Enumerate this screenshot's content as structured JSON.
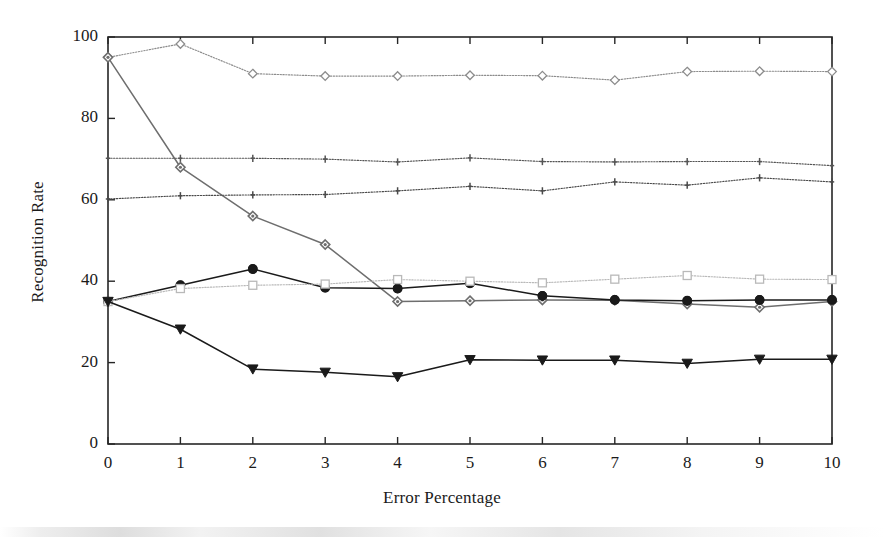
{
  "chart_data": {
    "type": "line",
    "title": "",
    "xlabel": "Error Percentage",
    "ylabel": "Recognition Rate",
    "x": [
      0,
      1,
      2,
      3,
      4,
      5,
      6,
      7,
      8,
      9,
      10
    ],
    "xlim": [
      0,
      10
    ],
    "ylim": [
      0,
      100
    ],
    "xticks": [
      "0",
      "1",
      "2",
      "3",
      "4",
      "5",
      "6",
      "7",
      "8",
      "9",
      "10"
    ],
    "yticks": [
      "0",
      "20",
      "40",
      "60",
      "80",
      "100"
    ],
    "grid": false,
    "legend": "none",
    "series": [
      {
        "name": "series-1-top-dotted-diamond",
        "marker": "diamond-open",
        "linestyle": "dotted",
        "color": "#8c8c8c",
        "values": [
          95.0,
          98.3,
          91.0,
          90.4,
          90.4,
          90.6,
          90.5,
          89.4,
          91.5,
          91.6,
          91.5
        ]
      },
      {
        "name": "series-2-descending-diamond",
        "marker": "diamond-filled",
        "linestyle": "solid",
        "color": "#6e6e6e",
        "values": [
          95.0,
          68.0,
          56.0,
          49.0,
          35.0,
          35.2,
          35.4,
          35.3,
          34.4,
          33.6,
          35.0
        ]
      },
      {
        "name": "series-3-flat-high-plus",
        "marker": "plus",
        "linestyle": "dotted",
        "color": "#555555",
        "values": [
          70.2,
          70.2,
          70.2,
          70.0,
          69.3,
          70.3,
          69.4,
          69.3,
          69.4,
          69.4,
          68.4
        ]
      },
      {
        "name": "series-4-flat-mid-plus",
        "marker": "plus",
        "linestyle": "dotted",
        "color": "#4a4a4a",
        "values": [
          60.2,
          61.0,
          61.2,
          61.3,
          62.2,
          63.3,
          62.2,
          64.4,
          63.6,
          65.4,
          64.4
        ]
      },
      {
        "name": "series-5-circle",
        "marker": "circle-filled",
        "linestyle": "solid",
        "color": "#1a1a1a",
        "values": [
          35.0,
          39.0,
          43.0,
          38.4,
          38.2,
          39.5,
          36.4,
          35.4,
          35.2,
          35.4,
          35.4
        ]
      },
      {
        "name": "series-6-square-open",
        "marker": "square-open",
        "linestyle": "dotted",
        "color": "#b9b9b9",
        "values": [
          35.0,
          38.2,
          39.0,
          39.3,
          40.4,
          40.0,
          39.6,
          40.5,
          41.4,
          40.5,
          40.4
        ]
      },
      {
        "name": "series-7-triangle-down",
        "marker": "triangle-down-filled",
        "linestyle": "solid",
        "color": "#1a1a1a",
        "values": [
          35.0,
          28.2,
          18.4,
          17.6,
          16.5,
          20.7,
          20.6,
          20.6,
          19.8,
          20.8,
          20.8
        ]
      }
    ]
  },
  "plot": {
    "left_px": 108,
    "right_px": 832,
    "top_px": 37,
    "bottom_px": 444,
    "frame_color": "#262626"
  }
}
